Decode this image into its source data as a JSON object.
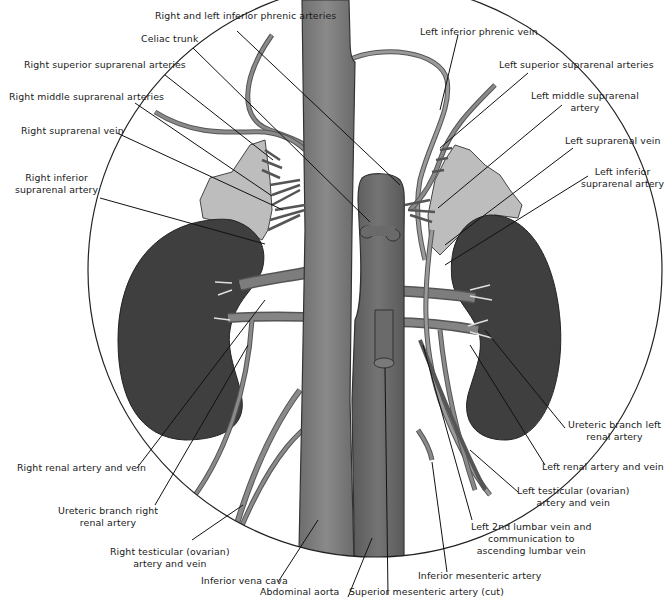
{
  "diagram": {
    "type": "anatomical-illustration",
    "colors": {
      "background": "#ffffff",
      "circle_outline": "#222222",
      "vessel_fill": "#7a7a7a",
      "vessel_dark": "#5e5e5e",
      "kidney_fill": "#3f3f3f",
      "suprarenal_fill": "#bdbdbd",
      "leader_line": "#111111",
      "label_text": "#1a1a1a"
    }
  },
  "labels": {
    "right_left_inferior_phrenic_arteries": "Right and left inferior phrenic arteries",
    "celiac_trunk": "Celiac trunk",
    "right_superior_suprarenal_arteries": "Right superior suprarenal arteries",
    "right_middle_suprarenal_arteries": "Right middle suprarenal arteries",
    "right_suprarenal_vein": "Right suprarenal vein",
    "right_inferior_suprarenal_artery": {
      "line1": "Right inferior",
      "line2": "suprarenal artery"
    },
    "left_inferior_phrenic_vein": "Left inferior phrenic vein",
    "left_superior_suprarenal_arteries": "Left superior suprarenal arteries",
    "left_middle_suprarenal_artery": {
      "line1": "Left middle suprarenal",
      "line2": "artery"
    },
    "left_suprarenal_vein": "Left suprarenal vein",
    "left_inferior_suprarenal_artery": {
      "line1": "Left inferior",
      "line2": "suprarenal artery"
    },
    "ureteric_branch_left_renal_artery": {
      "line1": "Ureteric branch left",
      "line2": "renal artery"
    },
    "left_renal_artery_and_vein": "Left renal artery and vein",
    "left_testicular_artery_and_vein": {
      "line1": "Left testicular (ovarian)",
      "line2": "artery and vein"
    },
    "left_2nd_lumbar_vein": {
      "line1": "Left 2nd lumbar vein and",
      "line2": "communication to",
      "line3": "ascending lumbar vein"
    },
    "inferior_mesenteric_artery": "Inferior mesenteric artery",
    "superior_mesenteric_artery_cut": "Superior mesenteric artery (cut)",
    "abdominal_aorta": "Abdominal aorta",
    "inferior_vena_cava": "Inferior vena cava",
    "right_testicular_artery_and_vein": {
      "line1": "Right testicular (ovarian)",
      "line2": "artery and vein"
    },
    "ureteric_branch_right_renal_artery": {
      "line1": "Ureteric branch right",
      "line2": "renal artery"
    },
    "right_renal_artery_and_vein": "Right renal artery and vein"
  }
}
